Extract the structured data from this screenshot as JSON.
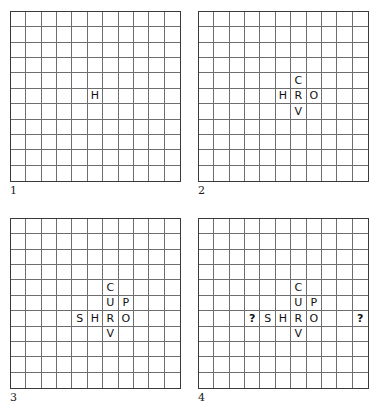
{
  "figure": {
    "type": "crossword-construction-sequence",
    "grid": {
      "columns": 11,
      "rows": 11
    },
    "panels": [
      {
        "label": "1",
        "name": "panel-1",
        "entries": [
          {
            "row": 6,
            "col": 6,
            "text": "H",
            "kind": "letter"
          }
        ]
      },
      {
        "label": "2",
        "name": "panel-2",
        "entries": [
          {
            "row": 5,
            "col": 7,
            "text": "C",
            "kind": "letter"
          },
          {
            "row": 6,
            "col": 6,
            "text": "H",
            "kind": "letter"
          },
          {
            "row": 6,
            "col": 7,
            "text": "R",
            "kind": "letter"
          },
          {
            "row": 6,
            "col": 8,
            "text": "O",
            "kind": "letter"
          },
          {
            "row": 7,
            "col": 7,
            "text": "V",
            "kind": "letter"
          }
        ]
      },
      {
        "label": "3",
        "name": "panel-3",
        "entries": [
          {
            "row": 5,
            "col": 7,
            "text": "C",
            "kind": "letter"
          },
          {
            "row": 6,
            "col": 7,
            "text": "U",
            "kind": "letter"
          },
          {
            "row": 6,
            "col": 8,
            "text": "P",
            "kind": "letter"
          },
          {
            "row": 7,
            "col": 5,
            "text": "S",
            "kind": "letter"
          },
          {
            "row": 7,
            "col": 6,
            "text": "H",
            "kind": "letter"
          },
          {
            "row": 7,
            "col": 7,
            "text": "R",
            "kind": "letter"
          },
          {
            "row": 7,
            "col": 8,
            "text": "O",
            "kind": "letter"
          },
          {
            "row": 8,
            "col": 7,
            "text": "V",
            "kind": "letter"
          }
        ]
      },
      {
        "label": "4",
        "name": "panel-4",
        "entries": [
          {
            "row": 5,
            "col": 7,
            "text": "C",
            "kind": "letter"
          },
          {
            "row": 6,
            "col": 7,
            "text": "U",
            "kind": "letter"
          },
          {
            "row": 6,
            "col": 8,
            "text": "P",
            "kind": "letter"
          },
          {
            "row": 7,
            "col": 4,
            "text": "?",
            "kind": "question"
          },
          {
            "row": 7,
            "col": 5,
            "text": "S",
            "kind": "letter"
          },
          {
            "row": 7,
            "col": 6,
            "text": "H",
            "kind": "letter"
          },
          {
            "row": 7,
            "col": 7,
            "text": "R",
            "kind": "letter"
          },
          {
            "row": 7,
            "col": 8,
            "text": "O",
            "kind": "letter"
          },
          {
            "row": 7,
            "col": 11,
            "text": "?",
            "kind": "question"
          },
          {
            "row": 8,
            "col": 7,
            "text": "V",
            "kind": "letter"
          }
        ]
      }
    ],
    "colors": {
      "background": "#ffffff",
      "grid_line": "#6e6e6e",
      "grid_border": "#3a3a3a",
      "letter": "#111111",
      "label": "#1a1a1a"
    }
  }
}
